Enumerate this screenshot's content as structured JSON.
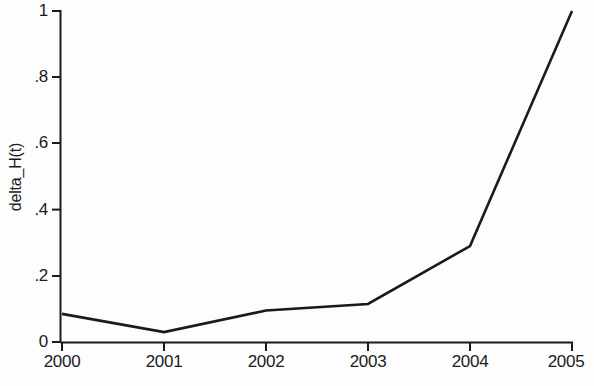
{
  "chart_data": {
    "type": "line",
    "title": "",
    "subtitle": "",
    "xlabel": "",
    "ylabel": "delta_H(t)",
    "x": [
      2000,
      2001,
      2002,
      2003,
      2004,
      2005
    ],
    "categories": [
      "2000",
      "2001",
      "2002",
      "2003",
      "2004",
      "2005"
    ],
    "values": [
      0.085,
      0.03,
      0.095,
      0.115,
      0.29,
      1
    ],
    "series": [
      {
        "name": "delta_H(t)",
        "values": [
          0.085,
          0.03,
          0.095,
          0.115,
          0.29,
          1
        ]
      }
    ],
    "xlim": [
      2000,
      2005
    ],
    "ylim": [
      0,
      1
    ],
    "xticks": [
      "2000",
      "2001",
      "2002",
      "2003",
      "2004",
      "2005"
    ],
    "yticks": [
      "0",
      ".2",
      ".4",
      ".6",
      ".8",
      "1"
    ],
    "ytick_values": [
      0,
      0.2,
      0.4,
      0.6,
      0.8,
      1
    ],
    "grid": false,
    "legend": false,
    "legend_position": "none",
    "markers": false,
    "line_color": "#1a1a1a",
    "background_color": "#fdfdfd",
    "axis_color": "#1b1b1b",
    "annotations": []
  }
}
